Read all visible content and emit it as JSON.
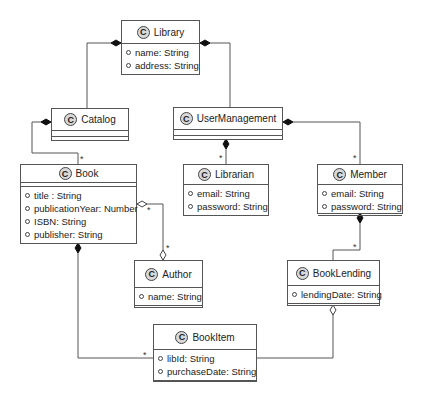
{
  "diagram": {
    "type": "UML class diagram",
    "classes": [
      {
        "id": "library",
        "name": "Library",
        "stereotype_icon": "C",
        "attributes": [
          "name: String",
          "address: String"
        ]
      },
      {
        "id": "catalog",
        "name": "Catalog",
        "stereotype_icon": "C",
        "attributes": []
      },
      {
        "id": "usermanagement",
        "name": "UserManagement",
        "stereotype_icon": "C",
        "attributes": []
      },
      {
        "id": "book",
        "name": "Book",
        "stereotype_icon": "C",
        "attributes": [
          "title : String",
          "publicationYear: Number",
          "ISBN: String",
          "publisher: String"
        ]
      },
      {
        "id": "librarian",
        "name": "Librarian",
        "stereotype_icon": "C",
        "attributes": [
          "email: String",
          "password: String"
        ]
      },
      {
        "id": "member",
        "name": "Member",
        "stereotype_icon": "C",
        "attributes": [
          "email: String",
          "password: String"
        ]
      },
      {
        "id": "author",
        "name": "Author",
        "stereotype_icon": "C",
        "attributes": [
          "name: String"
        ]
      },
      {
        "id": "booklending",
        "name": "BookLending",
        "stereotype_icon": "C",
        "attributes": [
          "lendingDate: String"
        ]
      },
      {
        "id": "bookitem",
        "name": "BookItem",
        "stereotype_icon": "C",
        "attributes": [
          "libId: String",
          "purchaseDate: String"
        ]
      }
    ],
    "relationships": [
      {
        "from": "Library",
        "to": "Catalog",
        "kind": "composition",
        "multiplicity": ""
      },
      {
        "from": "Library",
        "to": "UserManagement",
        "kind": "composition",
        "multiplicity": ""
      },
      {
        "from": "Catalog",
        "to": "Book",
        "kind": "composition",
        "multiplicity": "*"
      },
      {
        "from": "UserManagement",
        "to": "Librarian",
        "kind": "composition",
        "multiplicity": "*"
      },
      {
        "from": "UserManagement",
        "to": "Member",
        "kind": "composition",
        "multiplicity": "*"
      },
      {
        "from": "Book",
        "to": "Author",
        "kind": "aggregation",
        "multiplicity_from": "*",
        "multiplicity_to": "*"
      },
      {
        "from": "Member",
        "to": "BookLending",
        "kind": "composition",
        "multiplicity": "*"
      },
      {
        "from": "Book",
        "to": "BookItem",
        "kind": "composition",
        "multiplicity": "*"
      },
      {
        "from": "BookLending",
        "to": "BookItem",
        "kind": "aggregation",
        "multiplicity": ""
      }
    ],
    "multiplicity_star": "*"
  }
}
